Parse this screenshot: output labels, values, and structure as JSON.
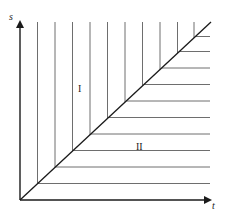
{
  "diagram": {
    "axes": {
      "x_label": "t",
      "y_label": "s"
    },
    "regions": [
      {
        "label": "I",
        "description": "above diagonal s = t, vertical hatching"
      },
      {
        "label": "II",
        "description": "below diagonal s = t, horizontal hatching"
      }
    ],
    "diagonal": "s = t",
    "colors": {
      "axis": "#1a1a1a",
      "diagonal": "#1a1a1a",
      "hatch": "#6e6e6e",
      "background": "#ffffff"
    }
  }
}
